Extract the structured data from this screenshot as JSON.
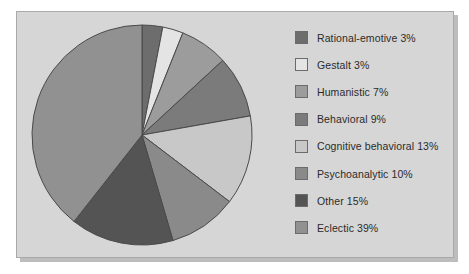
{
  "figure": {
    "background_color": "#ffffff",
    "panel_color": "#d6d6d6",
    "panel_border_color": "#a9a9a9",
    "shadow_color": "#bdbdbd"
  },
  "chart_data": {
    "type": "pie",
    "title": "",
    "subtitle": "",
    "xlabel": "",
    "ylabel": "",
    "grid": false,
    "legend_position": "right",
    "start_angle_deg": 0,
    "direction": "clockwise",
    "units": "%",
    "categories": [
      "Rational-emotive",
      "Gestalt",
      "Humanistic",
      "Behavioral",
      "Cognitive behavioral",
      "Psychoanalytic",
      "Other",
      "Eclectic"
    ],
    "values": [
      3,
      3,
      7,
      9,
      13,
      10,
      15,
      39
    ],
    "colors": [
      "#6d6d6d",
      "#e4e4e4",
      "#9c9c9c",
      "#7b7b7b",
      "#c8c8c8",
      "#8a8a8a",
      "#545454",
      "#919191"
    ],
    "slice_border_color": "#4a4a4a",
    "total": 99
  },
  "legend": {
    "items": [
      {
        "label": "Rational-emotive 3%",
        "color": "#6d6d6d",
        "swatch_name": "legend-swatch-rational-emotive"
      },
      {
        "label": "Gestalt 3%",
        "color": "#e4e4e4",
        "swatch_name": "legend-swatch-gestalt"
      },
      {
        "label": "Humanistic 7%",
        "color": "#9c9c9c",
        "swatch_name": "legend-swatch-humanistic"
      },
      {
        "label": "Behavioral 9%",
        "color": "#7b7b7b",
        "swatch_name": "legend-swatch-behavioral"
      },
      {
        "label": "Cognitive behavioral 13%",
        "color": "#c8c8c8",
        "swatch_name": "legend-swatch-cognitive-behavioral"
      },
      {
        "label": "Psychoanalytic 10%",
        "color": "#8a8a8a",
        "swatch_name": "legend-swatch-psychoanalytic"
      },
      {
        "label": "Other 15%",
        "color": "#545454",
        "swatch_name": "legend-swatch-other"
      },
      {
        "label": "Eclectic 39%",
        "color": "#919191",
        "swatch_name": "legend-swatch-eclectic"
      }
    ]
  }
}
